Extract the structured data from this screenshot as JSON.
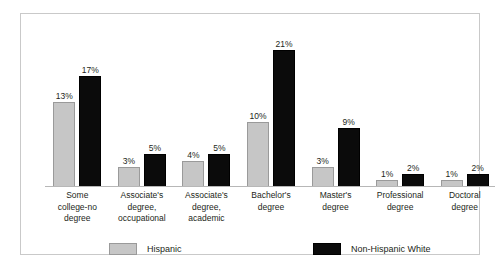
{
  "chart_data": {
    "type": "bar",
    "title": "",
    "xlabel": "",
    "ylabel": "",
    "ylim": [
      0,
      24
    ],
    "grid": false,
    "legend_position": "bottom",
    "categories": [
      "Some college-no degree",
      "Associate's degree, occupational",
      "Associate's degree, academic",
      "Bachelor's degree",
      "Master's degree",
      "Professional degree",
      "Doctoral degree"
    ],
    "category_lines": [
      [
        "Some",
        "college-no",
        "degree"
      ],
      [
        "Associate's",
        "degree,",
        "occupational"
      ],
      [
        "Associate's",
        "degree,",
        "academic"
      ],
      [
        "Bachelor's",
        "degree"
      ],
      [
        "Master's",
        "degree"
      ],
      [
        "Professional",
        "degree"
      ],
      [
        "Doctoral",
        "degree"
      ]
    ],
    "series": [
      {
        "name": "Hispanic",
        "color": "#c6c6c6",
        "values": [
          13,
          3,
          4,
          10,
          3,
          1,
          1
        ],
        "labels": [
          "13%",
          "3%",
          "4%",
          "10%",
          "3%",
          "1%",
          "1%"
        ]
      },
      {
        "name": "Non-Hispanic White",
        "color": "#0b0b0b",
        "values": [
          17,
          5,
          5,
          21,
          9,
          2,
          2
        ],
        "labels": [
          "17%",
          "5%",
          "5%",
          "21%",
          "9%",
          "2%",
          "2%"
        ]
      }
    ]
  },
  "legend": {
    "items": [
      {
        "label": "Hispanic"
      },
      {
        "label": "Non-Hispanic White"
      }
    ]
  }
}
